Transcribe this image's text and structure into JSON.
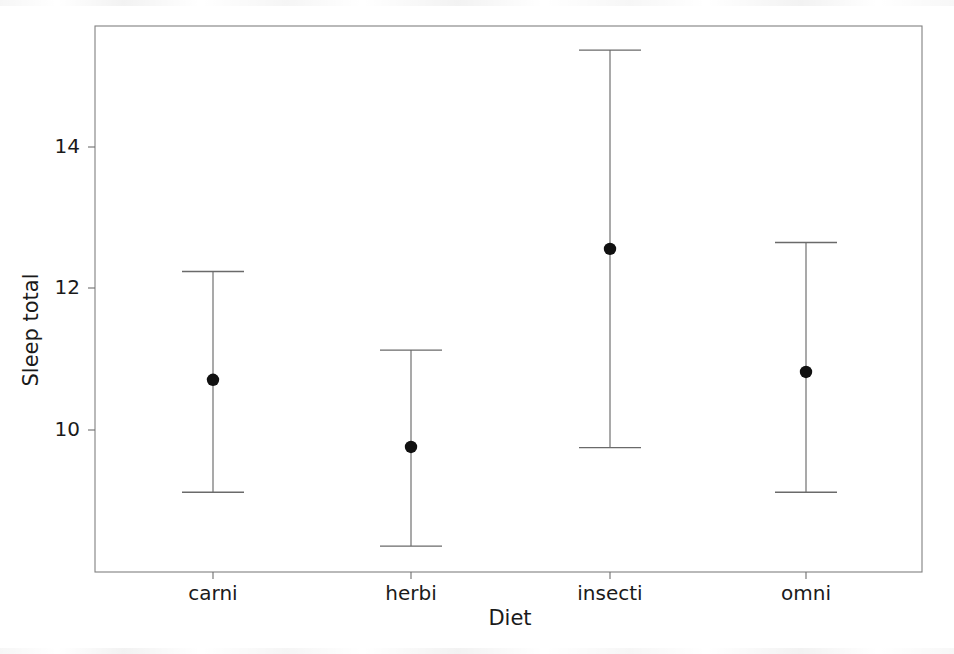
{
  "chart_data": {
    "type": "scatter",
    "title": "",
    "subtitle": "",
    "xlabel": "Diet",
    "ylabel": "Sleep total",
    "categories": [
      "carni",
      "herbi",
      "insecti",
      "omni"
    ],
    "values": [
      10.71,
      9.76,
      12.56,
      10.82
    ],
    "error_low": [
      9.12,
      8.36,
      9.75,
      9.12
    ],
    "error_high": [
      12.24,
      11.13,
      15.37,
      12.65
    ],
    "series": [
      {
        "name": "Mean sleep total with 95% confidence interval",
        "points": [
          {
            "category": "carni",
            "mean": 10.71,
            "lower": 9.12,
            "upper": 12.24
          },
          {
            "category": "herbi",
            "mean": 9.76,
            "lower": 8.36,
            "upper": 11.13
          },
          {
            "category": "insecti",
            "mean": 12.56,
            "lower": 9.75,
            "upper": 15.37
          },
          {
            "category": "omni",
            "mean": 10.82,
            "lower": 9.12,
            "upper": 12.65
          }
        ]
      }
    ],
    "ytick_labels": [
      "10",
      "12",
      "14"
    ],
    "ytick_values": [
      10,
      12,
      14
    ],
    "xtick_labels": [
      "carni",
      "herbi",
      "insecti",
      "omni"
    ],
    "ylim": [
      7.71,
      15.43
    ],
    "xlim": [
      0.5,
      4.5
    ],
    "grid": false,
    "legend": false,
    "legend_position": "none",
    "marker": "filled-circle",
    "errorbar_style": "capped-vertical",
    "colors": {
      "marker": "#111111",
      "errorbar": "#6a6a6a",
      "frame": "#808080",
      "text": "#1a1a1a",
      "background": "#ffffff"
    }
  },
  "plot": {
    "frame": {
      "left": 95,
      "top": 26,
      "right": 922,
      "bottom": 572
    },
    "y_axis": {
      "pixel_per_unit": 70.75,
      "ref_value": 14,
      "ref_pixel": 147
    },
    "category_x_pixels": [
      213,
      411,
      610,
      806
    ],
    "cap_half_width": 31
  },
  "labels": {
    "y_axis_title": "Sleep total",
    "x_axis_title": "Diet"
  }
}
